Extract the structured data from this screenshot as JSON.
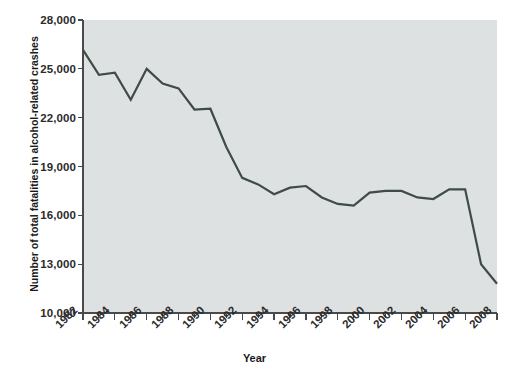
{
  "chart_data": {
    "type": "line",
    "title": "",
    "xlabel": "Year",
    "ylabel": "Number of total fatalities in alcohol-related crashes",
    "x": [
      1982,
      1983,
      1984,
      1985,
      1986,
      1987,
      1988,
      1989,
      1990,
      1991,
      1992,
      1993,
      1994,
      1995,
      1996,
      1997,
      1998,
      1999,
      2000,
      2001,
      2002,
      2003,
      2004,
      2005,
      2006,
      2007,
      2008
    ],
    "values": [
      26170,
      24635,
      24760,
      23100,
      25000,
      24100,
      23800,
      22500,
      22550,
      20200,
      18300,
      17900,
      17300,
      17700,
      17800,
      17100,
      16700,
      16600,
      17400,
      17500,
      17500,
      17100,
      17000,
      17600,
      17600,
      13000,
      11800
    ],
    "xtick_labels": [
      "1982",
      "1984",
      "1986",
      "1988",
      "1990",
      "1992",
      "1994",
      "1996",
      "1998",
      "2000",
      "2002",
      "2004",
      "2006",
      "2008"
    ],
    "xtick_values": [
      1982,
      1984,
      1986,
      1988,
      1990,
      1992,
      1994,
      1996,
      1998,
      2000,
      2002,
      2004,
      2006,
      2008
    ],
    "xminor_ticks": [
      1982,
      1983,
      1984,
      1985,
      1986,
      1987,
      1988,
      1989,
      1990,
      1991,
      1992,
      1993,
      1994,
      1995,
      1996,
      1997,
      1998,
      1999,
      2000,
      2001,
      2002,
      2003,
      2004,
      2005,
      2006,
      2007,
      2008
    ],
    "ytick_labels": [
      "28,000",
      "25,000",
      "22,000",
      "19,000",
      "16,000",
      "13,000",
      "10,000"
    ],
    "ytick_values": [
      28000,
      25000,
      22000,
      19000,
      16000,
      13000,
      10000
    ],
    "xlim": [
      1982,
      2008
    ],
    "ylim": [
      10000,
      28000
    ],
    "grid": false,
    "legend": false,
    "series_name": "Alcohol-related crash fatalities",
    "colors": {
      "line": "#3f4c45",
      "plot_background": "#dde1e1",
      "figure_background": "#ffffff",
      "axis": "#4a4a4a",
      "text": "#2b2b2b"
    },
    "line_width": 2.2
  }
}
